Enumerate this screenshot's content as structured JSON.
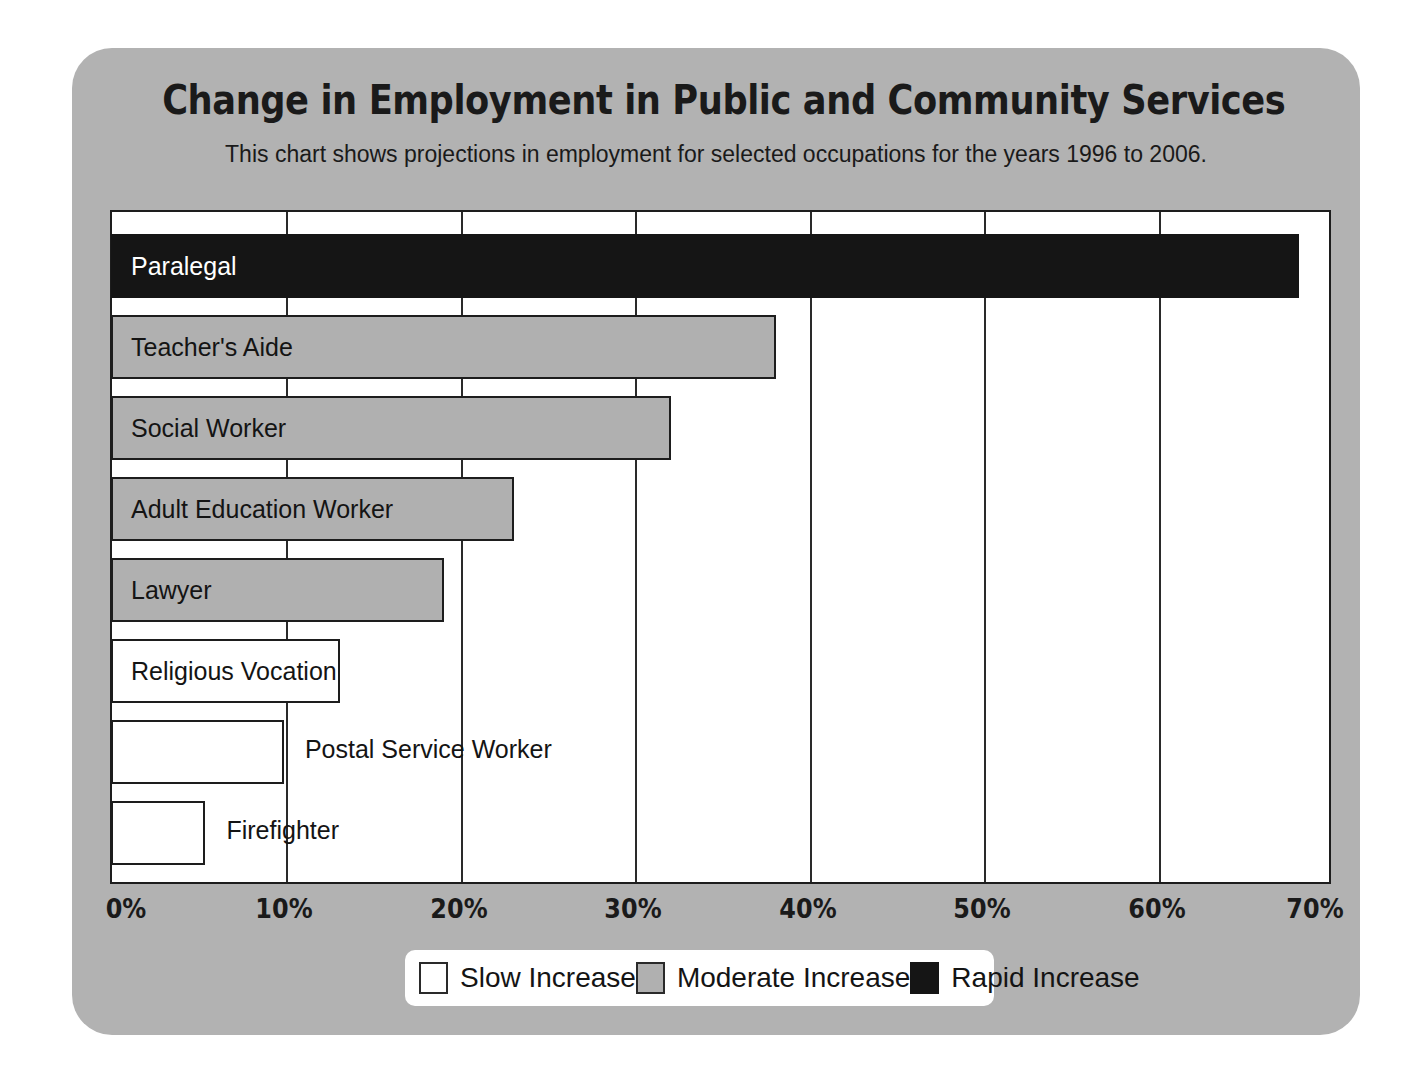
{
  "chart_data": {
    "type": "bar",
    "orientation": "horizontal",
    "title": "Change in Employment in Public and Community Services",
    "subtitle": "This chart shows projections in employment for selected occupations for the years 1996 to 2006.",
    "xlabel": "",
    "ylabel": "",
    "xlim": [
      0,
      70
    ],
    "xtick_labels": [
      "0%",
      "10%",
      "20%",
      "30%",
      "40%",
      "50%",
      "60%",
      "70%"
    ],
    "xtick_values": [
      0,
      10,
      20,
      30,
      40,
      50,
      60,
      70
    ],
    "grid": true,
    "legend_position": "bottom",
    "categories": [
      "Paralegal",
      "Teacher's Aide",
      "Social Worker",
      "Adult Education Worker",
      "Lawyer",
      "Religious Vocation",
      "Postal Service Worker",
      "Firefighter"
    ],
    "values": [
      68,
      38,
      32,
      23,
      19,
      13,
      9.8,
      5.3
    ],
    "bars": [
      {
        "label": "Paralegal",
        "value": 68,
        "category": "rapid",
        "label_inside": true
      },
      {
        "label": "Teacher's Aide",
        "value": 38,
        "category": "moderate",
        "label_inside": true
      },
      {
        "label": "Social Worker",
        "value": 32,
        "category": "moderate",
        "label_inside": true
      },
      {
        "label": "Adult Education Worker",
        "value": 23,
        "category": "moderate",
        "label_inside": true
      },
      {
        "label": "Lawyer",
        "value": 19,
        "category": "moderate",
        "label_inside": true
      },
      {
        "label": "Religious Vocation",
        "value": 13,
        "category": "slow",
        "label_inside": true
      },
      {
        "label": "Postal Service Worker",
        "value": 9.8,
        "category": "slow",
        "label_inside": false
      },
      {
        "label": "Firefighter",
        "value": 5.3,
        "category": "slow",
        "label_inside": false
      }
    ],
    "legend": [
      {
        "label": "Slow Increase",
        "category": "slow",
        "color": "#ffffff"
      },
      {
        "label": "Moderate Increase",
        "category": "moderate",
        "color": "#b0b0b0"
      },
      {
        "label": "Rapid Increase",
        "category": "rapid",
        "color": "#151515"
      }
    ]
  },
  "colors": {
    "card_background": "#b2b2b2",
    "page_background": "#ffffff",
    "plot_background": "#ffffff",
    "axis": "#1d1d1d",
    "slow": "#ffffff",
    "moderate": "#b0b0b0",
    "rapid": "#151515",
    "text": "#141414"
  }
}
